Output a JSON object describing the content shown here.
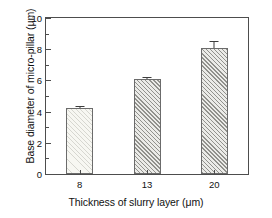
{
  "chart_data": {
    "type": "bar",
    "title": "",
    "xlabel": "Thickness of slurry layer (μm)",
    "ylabel": "Base diameter of micro-pillar (μm)",
    "categories": [
      "8",
      "13",
      "20"
    ],
    "values": [
      4.2,
      6.1,
      8.1
    ],
    "errors": [
      0.15,
      0.15,
      0.45
    ],
    "series": [
      {
        "name": "Base diameter of micro-pillar",
        "values": [
          4.2,
          6.1,
          8.1
        ],
        "errors": [
          0.15,
          0.15,
          0.45
        ]
      }
    ],
    "ylim": [
      0,
      10
    ],
    "ytick_labels": [
      "0",
      "2",
      "4",
      "6",
      "8",
      "10"
    ],
    "ytick_values": [
      0,
      2,
      4,
      6,
      8,
      10
    ],
    "yminor_values": [
      1,
      3,
      5,
      7,
      9
    ],
    "xtick_labels": [
      "8",
      "13",
      "20"
    ],
    "grid": false,
    "legend": null,
    "legend_position": "none",
    "frame": "box",
    "bar_styles": [
      "light-diagonal-hatch",
      "gray-diagonal-hatch",
      "gray-diagonal-hatch"
    ],
    "colors": {
      "axis": "#4d4d4d",
      "text": "#111111",
      "bar_light_fill": "#f7f7f2",
      "bar_hatch_fill": "#ebebe8",
      "bar_edge": "#6b6b6b",
      "error_bar": "#3d3d3d",
      "background": "#ffffff"
    }
  }
}
